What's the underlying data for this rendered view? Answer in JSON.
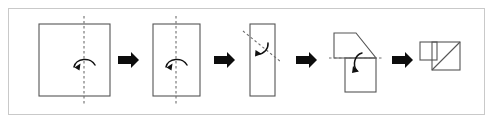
{
  "figure": {
    "background_color": "#ffffff",
    "frame_color": "#c9c9c9",
    "line_color": "#555555",
    "fold_line_color": "#6e6e6e",
    "arrow_color": "#0d0d0d"
  },
  "chart_data": {
    "type": "diagram",
    "title": "Paper folding sequence",
    "steps": [
      {
        "index": 1,
        "name": "square-with-vertical-fold",
        "shape": "square",
        "shape_bounds": {
          "x": 39,
          "y": 24,
          "width": 71,
          "height": 72
        },
        "fold_line": {
          "orientation": "vertical",
          "x": 84,
          "y1": 16,
          "y2": 104,
          "style": "dashed"
        },
        "fold_arrow": {
          "direction": "right-to-left",
          "cx": 84,
          "cy": 66
        }
      },
      {
        "index": 2,
        "name": "tall-rectangle-with-vertical-fold",
        "shape": "rectangle",
        "shape_bounds": {
          "x": 153,
          "y": 24,
          "width": 47,
          "height": 72
        },
        "fold_line": {
          "orientation": "vertical",
          "x": 176,
          "y1": 16,
          "y2": 104,
          "style": "dashed"
        },
        "fold_arrow": {
          "direction": "right-to-left",
          "cx": 176,
          "cy": 66
        }
      },
      {
        "index": 3,
        "name": "narrow-rectangle-with-diagonal-fold",
        "shape": "rectangle",
        "shape_bounds": {
          "x": 250,
          "y": 24,
          "width": 25,
          "height": 72
        },
        "fold_line": {
          "orientation": "diagonal",
          "x1": 243,
          "y1": 31,
          "x2": 281,
          "y2": 62,
          "style": "dashed"
        },
        "fold_arrow": {
          "direction": "down-left",
          "cx": 262,
          "cy": 48
        }
      },
      {
        "index": 4,
        "name": "folded-flap-with-horizontal-fold",
        "shape": "polygon-with-flap",
        "flap_points": "334,33 356,33 376,58 334,58",
        "lower_rect_bounds": {
          "x": 345,
          "y": 58,
          "width": 31,
          "height": 34
        },
        "fold_line": {
          "orientation": "horizontal",
          "y": 58,
          "x1": 329,
          "x2": 384,
          "style": "dashed"
        },
        "fold_arrow": {
          "direction": "down",
          "cx": 357,
          "cy": 63
        }
      },
      {
        "index": 5,
        "name": "final-folded-result",
        "shape": "square-with-diagonal-and-flap",
        "main_square_bounds": {
          "x": 432,
          "y": 42,
          "width": 28,
          "height": 28
        },
        "flap_square_bounds": {
          "x": 420,
          "y": 42,
          "width": 17,
          "height": 18
        },
        "diagonal": {
          "x1": 432,
          "y1": 70,
          "x2": 460,
          "y2": 42
        }
      }
    ],
    "transition_arrows": [
      {
        "index": 1,
        "label": "then",
        "x": 118,
        "y": 60
      },
      {
        "index": 2,
        "label": "then",
        "x": 214,
        "y": 60
      },
      {
        "index": 3,
        "label": "then",
        "x": 296,
        "y": 60
      },
      {
        "index": 4,
        "label": "then",
        "x": 392,
        "y": 60
      }
    ],
    "xlabel": "",
    "ylabel": "",
    "legend": []
  }
}
